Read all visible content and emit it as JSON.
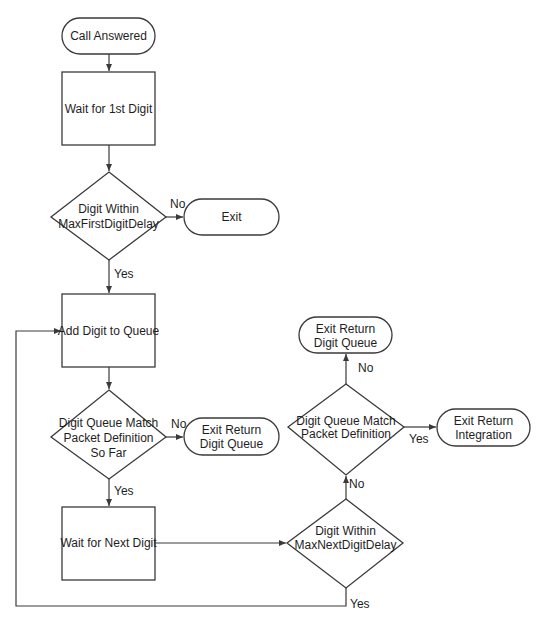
{
  "diagram": {
    "type": "flowchart",
    "nodes": {
      "call_answered": {
        "kind": "terminator",
        "label": "Call Answered"
      },
      "wait_first": {
        "kind": "process",
        "label": "Wait for 1st Digit"
      },
      "decision_first": {
        "kind": "decision",
        "line1": "Digit Within",
        "line2": "MaxFirstDigitDelay"
      },
      "exit": {
        "kind": "terminator",
        "label": "Exit"
      },
      "add_digit": {
        "kind": "process",
        "label": "Add Digit to Queue"
      },
      "decision_match_so_far": {
        "kind": "decision",
        "line1": "Digit Queue Match",
        "line2": "Packet Definition",
        "line3": "So Far"
      },
      "exit_return_queue_1": {
        "kind": "terminator",
        "line1": "Exit Return",
        "line2": "Digit Queue"
      },
      "wait_next": {
        "kind": "process",
        "label": "Wait for Next Digit"
      },
      "decision_next": {
        "kind": "decision",
        "line1": "Digit Within",
        "line2": "MaxNextDigitDelay"
      },
      "decision_match": {
        "kind": "decision",
        "line1": "Digit Queue Match",
        "line2": "Packet Definition"
      },
      "exit_return_queue_2": {
        "kind": "terminator",
        "line1": "Exit Return",
        "line2": "Digit Queue"
      },
      "exit_return_integration": {
        "kind": "terminator",
        "line1": "Exit Return",
        "line2": "Integration"
      }
    },
    "edge_labels": {
      "first_no": "No",
      "first_yes": "Yes",
      "so_far_no": "No",
      "so_far_yes": "Yes",
      "next_no": "No",
      "next_yes": "Yes",
      "match_no": "No",
      "match_yes": "Yes"
    },
    "edges": [
      {
        "from": "Call Answered",
        "to": "Wait for 1st Digit"
      },
      {
        "from": "Wait for 1st Digit",
        "to": "Digit Within MaxFirstDigitDelay"
      },
      {
        "from": "Digit Within MaxFirstDigitDelay",
        "to": "Exit",
        "label": "No"
      },
      {
        "from": "Digit Within MaxFirstDigitDelay",
        "to": "Add Digit to Queue",
        "label": "Yes"
      },
      {
        "from": "Add Digit to Queue",
        "to": "Digit Queue Match Packet Definition So Far"
      },
      {
        "from": "Digit Queue Match Packet Definition So Far",
        "to": "Exit Return Digit Queue",
        "label": "No"
      },
      {
        "from": "Digit Queue Match Packet Definition So Far",
        "to": "Wait for Next Digit",
        "label": "Yes"
      },
      {
        "from": "Wait for Next Digit",
        "to": "Digit Within MaxNextDigitDelay"
      },
      {
        "from": "Digit Within MaxNextDigitDelay",
        "to": "Digit Queue Match Packet Definition",
        "label": "No"
      },
      {
        "from": "Digit Within MaxNextDigitDelay",
        "to": "Add Digit to Queue",
        "label": "Yes"
      },
      {
        "from": "Digit Queue Match Packet Definition",
        "to": "Exit Return Digit Queue",
        "label": "No"
      },
      {
        "from": "Digit Queue Match Packet Definition",
        "to": "Exit Return Integration",
        "label": "Yes"
      }
    ]
  }
}
